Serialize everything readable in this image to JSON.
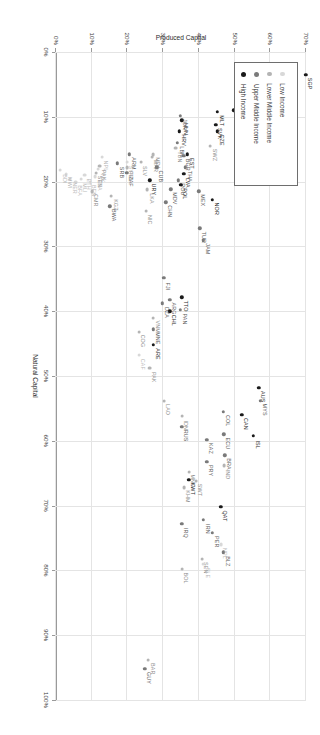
{
  "chart": {
    "type": "scatter",
    "title": "",
    "xlabel": "Natural Capital",
    "ylabel": "Produced Capital",
    "xlim": [
      0,
      1.0
    ],
    "ylim": [
      0,
      0.7
    ],
    "grid": true,
    "xticks": [
      "0%",
      "10%",
      "20%",
      "30%",
      "40%",
      "50%",
      "60%",
      "70%",
      "80%",
      "90%",
      "100%"
    ],
    "xtick_values": [
      0,
      0.1,
      0.2,
      0.3,
      0.4,
      0.5,
      0.6,
      0.7,
      0.8,
      0.9,
      1.0
    ],
    "yticks": [
      "0%",
      "10%",
      "20%",
      "30%",
      "40%",
      "50%",
      "60%",
      "70%"
    ],
    "ytick_values": [
      0,
      0.1,
      0.2,
      0.3,
      0.4,
      0.5,
      0.6,
      0.7
    ]
  },
  "legend": {
    "position": "top-left",
    "items": [
      {
        "label": "Low Income",
        "color": "#d8d8d8",
        "group": "low"
      },
      {
        "label": "Lower Middle Income",
        "color": "#b4b4b4",
        "group": "lower_middle"
      },
      {
        "label": "Upper Middle Income",
        "color": "#7a7a7a",
        "group": "upper_middle"
      },
      {
        "label": "High Income",
        "color": "#1a1a1a",
        "group": "high"
      }
    ]
  },
  "colors": {
    "low": "#d8d8d8",
    "lower_middle": "#b4b4b4",
    "upper_middle": "#7a7a7a",
    "high": "#1a1a1a",
    "grid": "#e4e4e4",
    "axis": "#9a9a9a",
    "label_text": "#4a4a4a"
  },
  "chart_data": {
    "type": "scatter",
    "title": "",
    "xlabel": "Natural Capital",
    "ylabel": "Produced Capital",
    "xlim": [
      0,
      1.0
    ],
    "ylim": [
      0,
      0.7
    ],
    "grid": true,
    "legend_position": "top-left",
    "xticks": [
      "0%",
      "10%",
      "20%",
      "30%",
      "40%",
      "50%",
      "60%",
      "70%",
      "80%",
      "90%",
      "100%"
    ],
    "yticks": [
      "0%",
      "10%",
      "20%",
      "30%",
      "40%",
      "50%",
      "60%",
      "70%"
    ],
    "series": [
      {
        "name": "Low Income",
        "color": "#d8d8d8"
      },
      {
        "name": "Lower Middle Income",
        "color": "#b4b4b4"
      },
      {
        "name": "Upper Middle Income",
        "color": "#7a7a7a"
      },
      {
        "name": "High Income",
        "color": "#1a1a1a"
      }
    ],
    "points": [
      {
        "label": "SGP",
        "x": 0.035,
        "y": 0.7,
        "group": "high"
      },
      {
        "label": "LUX",
        "x": 0.055,
        "y": 0.608,
        "group": "high"
      },
      {
        "label": "ESP",
        "x": 0.072,
        "y": 0.612,
        "group": "high"
      },
      {
        "label": "PRT",
        "x": 0.085,
        "y": 0.598,
        "group": "high"
      },
      {
        "label": "KOR",
        "x": 0.108,
        "y": 0.592,
        "group": "high"
      },
      {
        "label": "FRA",
        "x": 0.06,
        "y": 0.59,
        "group": "high"
      },
      {
        "label": "ITA",
        "x": 0.062,
        "y": 0.578,
        "group": "high"
      },
      {
        "label": "JPN",
        "x": 0.05,
        "y": 0.572,
        "group": "high"
      },
      {
        "label": "BEL",
        "x": 0.062,
        "y": 0.56,
        "group": "high"
      },
      {
        "label": "DNK",
        "x": 0.078,
        "y": 0.562,
        "group": "high"
      },
      {
        "label": "CYP",
        "x": 0.08,
        "y": 0.545,
        "group": "high"
      },
      {
        "label": "HKG",
        "x": 0.098,
        "y": 0.552,
        "group": "high"
      },
      {
        "label": "SWE",
        "x": 0.112,
        "y": 0.552,
        "group": "high"
      },
      {
        "label": "NLD",
        "x": 0.056,
        "y": 0.545,
        "group": "high"
      },
      {
        "label": "BRB",
        "x": 0.086,
        "y": 0.512,
        "group": "high"
      },
      {
        "label": "ISR",
        "x": 0.09,
        "y": 0.498,
        "group": "high"
      },
      {
        "label": "DEU",
        "x": 0.128,
        "y": 0.518,
        "group": "high"
      },
      {
        "label": "SVN",
        "x": 0.142,
        "y": 0.518,
        "group": "high"
      },
      {
        "label": "GBR",
        "x": 0.152,
        "y": 0.525,
        "group": "high"
      },
      {
        "label": "USA",
        "x": 0.16,
        "y": 0.532,
        "group": "high"
      },
      {
        "label": "FIN",
        "x": 0.15,
        "y": 0.515,
        "group": "high"
      },
      {
        "label": "MLT",
        "x": 0.092,
        "y": 0.452,
        "group": "high"
      },
      {
        "label": "SVK",
        "x": 0.112,
        "y": 0.448,
        "group": "high"
      },
      {
        "label": "CZE",
        "x": 0.122,
        "y": 0.452,
        "group": "high"
      },
      {
        "label": "SWZ",
        "x": 0.145,
        "y": 0.432,
        "group": "lower_middle"
      },
      {
        "label": "NOR",
        "x": 0.228,
        "y": 0.438,
        "group": "high"
      },
      {
        "label": "HUN",
        "x": 0.105,
        "y": 0.352,
        "group": "high"
      },
      {
        "label": "JOR",
        "x": 0.098,
        "y": 0.348,
        "group": "upper_middle"
      },
      {
        "label": "HRV",
        "x": 0.122,
        "y": 0.345,
        "group": "high"
      },
      {
        "label": "LBN",
        "x": 0.14,
        "y": 0.34,
        "group": "upper_middle"
      },
      {
        "label": "TUN",
        "x": 0.148,
        "y": 0.335,
        "group": "lower_middle"
      },
      {
        "label": "EST",
        "x": 0.158,
        "y": 0.368,
        "group": "high"
      },
      {
        "label": "BGR",
        "x": 0.16,
        "y": 0.358,
        "group": "upper_middle"
      },
      {
        "label": "THA",
        "x": 0.178,
        "y": 0.362,
        "group": "upper_middle"
      },
      {
        "label": "LVA",
        "x": 0.188,
        "y": 0.358,
        "group": "high"
      },
      {
        "label": "ROU",
        "x": 0.198,
        "y": 0.342,
        "group": "upper_middle"
      },
      {
        "label": "POL",
        "x": 0.205,
        "y": 0.35,
        "group": "high"
      },
      {
        "label": "MEX",
        "x": 0.215,
        "y": 0.4,
        "group": "upper_middle"
      },
      {
        "label": "TUR",
        "x": 0.272,
        "y": 0.402,
        "group": "upper_middle"
      },
      {
        "label": "JAM",
        "x": 0.29,
        "y": 0.412,
        "group": "upper_middle"
      },
      {
        "label": "MDV",
        "x": 0.212,
        "y": 0.322,
        "group": "upper_middle"
      },
      {
        "label": "CHN",
        "x": 0.232,
        "y": 0.308,
        "group": "upper_middle"
      },
      {
        "label": "MDA",
        "x": 0.158,
        "y": 0.272,
        "group": "lower_middle"
      },
      {
        "label": "MAR",
        "x": 0.162,
        "y": 0.268,
        "group": "lower_middle"
      },
      {
        "label": "CUB",
        "x": 0.178,
        "y": 0.282,
        "group": "upper_middle"
      },
      {
        "label": "URY",
        "x": 0.198,
        "y": 0.262,
        "group": "high"
      },
      {
        "label": "LKA",
        "x": 0.212,
        "y": 0.255,
        "group": "lower_middle"
      },
      {
        "label": "NIC",
        "x": 0.245,
        "y": 0.252,
        "group": "lower_middle"
      },
      {
        "label": "SLV",
        "x": 0.17,
        "y": 0.238,
        "group": "lower_middle"
      },
      {
        "label": "ARM",
        "x": 0.158,
        "y": 0.205,
        "group": "upper_middle"
      },
      {
        "label": "SYR",
        "x": 0.17,
        "y": 0.198,
        "group": "low"
      },
      {
        "label": "PHL",
        "x": 0.178,
        "y": 0.198,
        "group": "lower_middle"
      },
      {
        "label": "ZAF",
        "x": 0.186,
        "y": 0.198,
        "group": "upper_middle"
      },
      {
        "label": "SRB",
        "x": 0.172,
        "y": 0.172,
        "group": "upper_middle"
      },
      {
        "label": "KGZ",
        "x": 0.222,
        "y": 0.155,
        "group": "lower_middle"
      },
      {
        "label": "BWA",
        "x": 0.238,
        "y": 0.15,
        "group": "upper_middle"
      },
      {
        "label": "NPL",
        "x": 0.162,
        "y": 0.128,
        "group": "low"
      },
      {
        "label": "PAK",
        "x": 0.176,
        "y": 0.122,
        "group": "lower_middle"
      },
      {
        "label": "TJK",
        "x": 0.18,
        "y": 0.118,
        "group": "low"
      },
      {
        "label": "SEN",
        "x": 0.186,
        "y": 0.112,
        "group": "lower_middle"
      },
      {
        "label": "TZA",
        "x": 0.192,
        "y": 0.11,
        "group": "low"
      },
      {
        "label": "CMR",
        "x": 0.215,
        "y": 0.1,
        "group": "lower_middle"
      },
      {
        "label": "BEN",
        "x": 0.2,
        "y": 0.095,
        "group": "low"
      },
      {
        "label": "ETH",
        "x": 0.19,
        "y": 0.08,
        "group": "low"
      },
      {
        "label": "MLI",
        "x": 0.196,
        "y": 0.07,
        "group": "low"
      },
      {
        "label": "BFA",
        "x": 0.2,
        "y": 0.055,
        "group": "low"
      },
      {
        "label": "NER",
        "x": 0.196,
        "y": 0.04,
        "group": "low"
      },
      {
        "label": "MWI",
        "x": 0.188,
        "y": 0.028,
        "group": "low"
      },
      {
        "label": "BDI",
        "x": 0.182,
        "y": 0.012,
        "group": "low"
      },
      {
        "label": "TTO",
        "x": 0.378,
        "y": 0.352,
        "group": "high"
      },
      {
        "label": "PAN",
        "x": 0.398,
        "y": 0.348,
        "group": "upper_middle"
      },
      {
        "label": "ARG",
        "x": 0.382,
        "y": 0.318,
        "group": "upper_middle"
      },
      {
        "label": "CHL",
        "x": 0.4,
        "y": 0.318,
        "group": "high"
      },
      {
        "label": "FJI",
        "x": 0.348,
        "y": 0.302,
        "group": "upper_middle"
      },
      {
        "label": "DZA",
        "x": 0.388,
        "y": 0.298,
        "group": "upper_middle"
      },
      {
        "label": "ARE",
        "x": 0.452,
        "y": 0.272,
        "group": "high"
      },
      {
        "label": "VNM",
        "x": 0.41,
        "y": 0.272,
        "group": "lower_middle"
      },
      {
        "label": "MNE",
        "x": 0.428,
        "y": 0.272,
        "group": "upper_middle"
      },
      {
        "label": "COG",
        "x": 0.432,
        "y": 0.232,
        "group": "lower_middle"
      },
      {
        "label": "CAF",
        "x": 0.468,
        "y": 0.232,
        "group": "low"
      },
      {
        "label": "AUS",
        "x": 0.518,
        "y": 0.568,
        "group": "high"
      },
      {
        "label": "MYS",
        "x": 0.538,
        "y": 0.572,
        "group": "upper_middle"
      },
      {
        "label": "CAN",
        "x": 0.56,
        "y": 0.52,
        "group": "high"
      },
      {
        "label": "ISL",
        "x": 0.592,
        "y": 0.552,
        "group": "high"
      },
      {
        "label": "COL",
        "x": 0.555,
        "y": 0.468,
        "group": "upper_middle"
      },
      {
        "label": "ECU",
        "x": 0.59,
        "y": 0.47,
        "group": "upper_middle"
      },
      {
        "label": "BRA",
        "x": 0.622,
        "y": 0.472,
        "group": "upper_middle"
      },
      {
        "label": "IND",
        "x": 0.638,
        "y": 0.47,
        "group": "lower_middle"
      },
      {
        "label": "KAZ",
        "x": 0.598,
        "y": 0.422,
        "group": "upper_middle"
      },
      {
        "label": "PRY",
        "x": 0.632,
        "y": 0.422,
        "group": "upper_middle"
      },
      {
        "label": "IDN",
        "x": 0.562,
        "y": 0.352,
        "group": "lower_middle"
      },
      {
        "label": "RUS",
        "x": 0.578,
        "y": 0.352,
        "group": "upper_middle"
      },
      {
        "label": "LAO",
        "x": 0.538,
        "y": 0.302,
        "group": "lower_middle"
      },
      {
        "label": "PAK",
        "x": 0.488,
        "y": 0.262,
        "group": "lower_middle"
      },
      {
        "label": "SWT",
        "x": 0.662,
        "y": 0.392,
        "group": "lower_middle"
      },
      {
        "label": "MNG",
        "x": 0.648,
        "y": 0.372,
        "group": "lower_middle"
      },
      {
        "label": "KWT",
        "x": 0.66,
        "y": 0.372,
        "group": "high"
      },
      {
        "label": "KHM",
        "x": 0.672,
        "y": 0.358,
        "group": "lower_middle"
      },
      {
        "label": "QAT",
        "x": 0.702,
        "y": 0.462,
        "group": "high"
      },
      {
        "label": "IRN",
        "x": 0.722,
        "y": 0.412,
        "group": "upper_middle"
      },
      {
        "label": "PER",
        "x": 0.742,
        "y": 0.438,
        "group": "upper_middle"
      },
      {
        "label": "NPL",
        "x": 0.76,
        "y": 0.462,
        "group": "low"
      },
      {
        "label": "BLZ",
        "x": 0.772,
        "y": 0.468,
        "group": "upper_middle"
      },
      {
        "label": "IRQ",
        "x": 0.728,
        "y": 0.352,
        "group": "upper_middle"
      },
      {
        "label": "SEN",
        "x": 0.782,
        "y": 0.408,
        "group": "lower_middle"
      },
      {
        "label": "SLE",
        "x": 0.79,
        "y": 0.412,
        "group": "low"
      },
      {
        "label": "BOL",
        "x": 0.798,
        "y": 0.352,
        "group": "lower_middle"
      },
      {
        "label": "BAR",
        "x": 0.938,
        "y": 0.258,
        "group": "lower_middle"
      },
      {
        "label": "GUY",
        "x": 0.952,
        "y": 0.248,
        "group": "upper_middle"
      }
    ]
  }
}
